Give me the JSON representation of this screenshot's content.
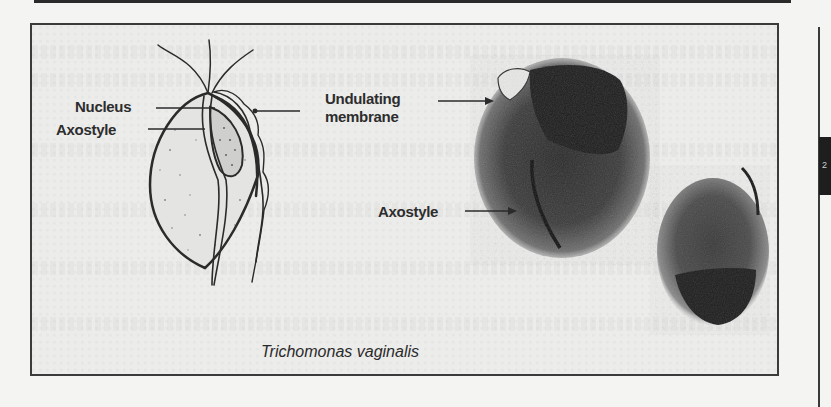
{
  "figure": {
    "caption": "Trichomonas vaginalis",
    "drawing_labels": {
      "nucleus": "Nucleus",
      "axostyle": "Axostyle",
      "undulating_membrane_line1": "Undulating",
      "undulating_membrane_line2": "membrane"
    },
    "micrograph_labels": {
      "axostyle": "Axostyle"
    },
    "side_tab": "2"
  },
  "colors": {
    "ink": "#2d2d2d",
    "paper": "#ececeb",
    "frame": "#3b3b3b"
  }
}
